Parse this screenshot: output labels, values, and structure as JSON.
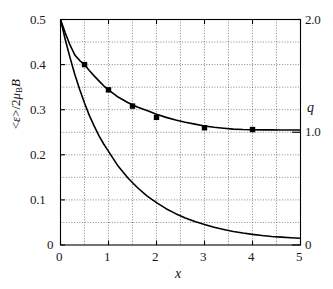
{
  "chart_data": {
    "type": "line",
    "title": "",
    "xlabel": "x",
    "ylabel_left": "<ε>/2μ_B B",
    "ylabel_right": "q",
    "xlim": [
      0,
      5
    ],
    "ylim_left": [
      0,
      0.5
    ],
    "ylim_right": [
      0,
      2.0
    ],
    "grid": true,
    "grid_style": "dotted",
    "grid_x_step": 0.5,
    "grid_y_step": 0.05,
    "legend_position": "none",
    "xticks": [
      "0",
      "1",
      "2",
      "3",
      "4",
      "5"
    ],
    "xtick_values": [
      0,
      1,
      2,
      3,
      4,
      5
    ],
    "yticks_left": [
      "0",
      "0.1",
      "0.2",
      "0.3",
      "0.4",
      "0.5"
    ],
    "ytick_values_left": [
      0,
      0.1,
      0.2,
      0.3,
      0.4,
      0.5
    ],
    "yticks_right": [
      "0",
      "1.0",
      "2.0"
    ],
    "ytick_values_right": [
      0,
      1.0,
      2.0
    ],
    "series": [
      {
        "name": "mean-energy-curve",
        "axis": "left",
        "style": "solid-line",
        "color": "#000000",
        "x": [
          0.0,
          0.1,
          0.2,
          0.3,
          0.4,
          0.5,
          0.6,
          0.7,
          0.8,
          0.9,
          1.0,
          1.2,
          1.4,
          1.6,
          1.8,
          2.0,
          2.2,
          2.4,
          2.6,
          2.8,
          3.0,
          3.2,
          3.4,
          3.6,
          3.8,
          4.0,
          4.2,
          4.4,
          4.6,
          4.8,
          5.0
        ],
        "values": [
          0.5,
          0.47,
          0.443,
          0.421,
          0.409,
          0.4,
          0.387,
          0.375,
          0.364,
          0.353,
          0.344,
          0.328,
          0.316,
          0.306,
          0.298,
          0.29,
          0.283,
          0.277,
          0.272,
          0.268,
          0.264,
          0.261,
          0.259,
          0.257,
          0.256,
          0.2555,
          0.2553,
          0.2552,
          0.2551,
          0.2551,
          0.255
        ]
      },
      {
        "name": "mean-energy-markers",
        "axis": "left",
        "style": "filled-square-markers",
        "color": "#000000",
        "x": [
          0.5,
          1.0,
          1.5,
          2.0,
          3.0,
          4.0
        ],
        "values": [
          0.4,
          0.344,
          0.308,
          0.283,
          0.26,
          0.256
        ]
      },
      {
        "name": "q-curve",
        "axis": "right",
        "style": "solid-line",
        "color": "#000000",
        "x": [
          0.0,
          0.1,
          0.2,
          0.3,
          0.4,
          0.5,
          0.6,
          0.7,
          0.8,
          0.9,
          1.0,
          1.2,
          1.4,
          1.6,
          1.8,
          2.0,
          2.2,
          2.4,
          2.6,
          2.8,
          3.0,
          3.2,
          3.4,
          3.6,
          3.8,
          4.0,
          4.2,
          4.4,
          4.6,
          4.8,
          5.0
        ],
        "values": [
          2.0,
          1.82,
          1.66,
          1.51,
          1.38,
          1.26,
          1.15,
          1.055,
          0.97,
          0.895,
          0.83,
          0.7,
          0.596,
          0.51,
          0.437,
          0.376,
          0.322,
          0.278,
          0.24,
          0.208,
          0.182,
          0.158,
          0.138,
          0.12,
          0.106,
          0.094,
          0.084,
          0.076,
          0.07,
          0.064,
          0.06
        ],
        "values_left_scale": [
          0.5,
          0.455,
          0.415,
          0.3775,
          0.345,
          0.315,
          0.2875,
          0.264,
          0.2425,
          0.224,
          0.2075,
          0.175,
          0.149,
          0.1275,
          0.109,
          0.094,
          0.0805,
          0.0695,
          0.06,
          0.052,
          0.0455,
          0.0395,
          0.0345,
          0.03,
          0.0265,
          0.0235,
          0.021,
          0.019,
          0.0175,
          0.016,
          0.015
        ]
      }
    ]
  },
  "axes": {
    "x_tick_labels": [
      "0",
      "1",
      "2",
      "3",
      "4",
      "5"
    ],
    "y_left_tick_labels": [
      "0.5",
      "0.4",
      "0.3",
      "0.2",
      "0.1",
      "0"
    ],
    "y_right_tick_labels": [
      "2.0",
      "1.0",
      "0"
    ],
    "x_axis_title": "x",
    "y_left_axis_title_parts": {
      "main": "<ε>/2",
      "mu": "μ",
      "sub": "B",
      "field": "B"
    },
    "y_right_axis_title": "q"
  },
  "style": {
    "line_color": "#000000",
    "grid_color": "#666666",
    "frame_color": "#000000",
    "background": "#ffffff",
    "marker_color": "#000000"
  }
}
